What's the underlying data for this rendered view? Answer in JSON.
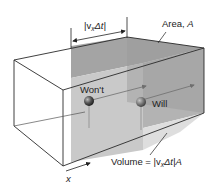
{
  "diagram": {
    "type": "3d-box-volume",
    "labels": {
      "dimension": "|v",
      "dimension_sub": "x",
      "dimension_tail": "Δt|",
      "area": "Area, ",
      "area_var": "A",
      "wont": "Won't",
      "will": "Will",
      "volume_prefix": "Volume = |v",
      "volume_sub": "x",
      "volume_tail": "Δt|",
      "volume_var": "A",
      "axis": "x"
    },
    "particles": [
      {
        "name": "wont",
        "label": "Won't"
      },
      {
        "name": "will",
        "label": "Will"
      }
    ],
    "colors": {
      "line": "#2a2a2a",
      "shade_top": "#9e9e9e",
      "shade_front": "#c4c4c4",
      "shade_right": "#b0b0b0",
      "shade_bottom": "#dcdcdc",
      "particle": "#555555",
      "arrow": "#7a7a7a"
    }
  }
}
